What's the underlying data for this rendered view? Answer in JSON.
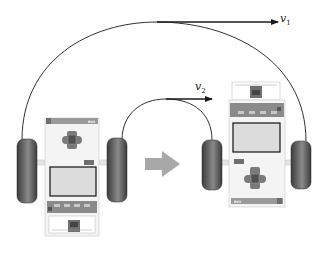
{
  "diagram": {
    "velocity_labels": {
      "outer": {
        "symbol": "v",
        "subscript": "1"
      },
      "inner": {
        "symbol": "v",
        "subscript": "2"
      }
    },
    "transition_arrow": "right",
    "robots": [
      {
        "id": "start",
        "orientation": "facing-down",
        "brick_label": "EV3"
      },
      {
        "id": "end",
        "orientation": "facing-up",
        "brick_label": "EV3"
      }
    ],
    "colors": {
      "line": "#1a1a1a",
      "transition_arrow": "#a8a8a8",
      "wheel": "#5a5a5a",
      "wheel_dark": "#3a3a3a",
      "body": "#f0f0f0",
      "body_outline": "#c8c8c8",
      "brick_bar": "#9a9a9a",
      "screen": "#dcdcdc",
      "screen_border": "#111111",
      "button": "#6e6e6e"
    }
  }
}
